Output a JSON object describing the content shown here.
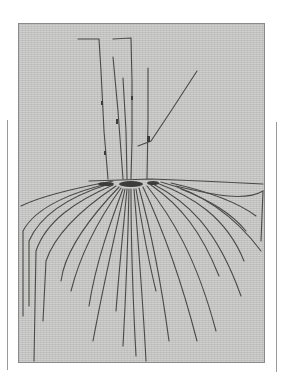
{
  "image": {
    "subject": "thread-artwork-on-linen",
    "colors": {
      "background": "#ffffff",
      "fabric": "#c9c9c7",
      "thread": "#4a4a48",
      "frame_line": "#9a9a9a"
    }
  }
}
